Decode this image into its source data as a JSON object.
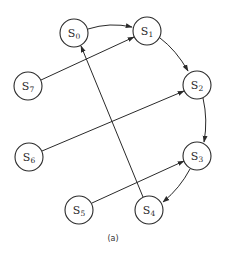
{
  "diagram": {
    "caption": "(a)",
    "colors": {
      "stroke": "#2a2a2a",
      "fill": "#ffffff"
    },
    "nodes": [
      {
        "id": "S0",
        "label": "S",
        "sub": "0",
        "x": 74,
        "y": 33
      },
      {
        "id": "S1",
        "label": "S",
        "sub": "1",
        "x": 147,
        "y": 31
      },
      {
        "id": "S2",
        "label": "S",
        "sub": "2",
        "x": 197,
        "y": 85
      },
      {
        "id": "S3",
        "label": "S",
        "sub": "3",
        "x": 197,
        "y": 156
      },
      {
        "id": "S4",
        "label": "S",
        "sub": "4",
        "x": 149,
        "y": 210
      },
      {
        "id": "S5",
        "label": "S",
        "sub": "5",
        "x": 79,
        "y": 210
      },
      {
        "id": "S6",
        "label": "S",
        "sub": "6",
        "x": 29,
        "y": 157
      },
      {
        "id": "S7",
        "label": "S",
        "sub": "7",
        "x": 28,
        "y": 86
      }
    ],
    "edges": [
      {
        "from": "S0",
        "to": "S1",
        "type": "curved"
      },
      {
        "from": "S1",
        "to": "S2",
        "type": "curved"
      },
      {
        "from": "S2",
        "to": "S3",
        "type": "curved"
      },
      {
        "from": "S3",
        "to": "S4",
        "type": "curved"
      },
      {
        "from": "S4",
        "to": "S0",
        "type": "straight"
      },
      {
        "from": "S5",
        "to": "S3",
        "type": "straight"
      },
      {
        "from": "S6",
        "to": "S2",
        "type": "straight"
      },
      {
        "from": "S7",
        "to": "S1",
        "type": "straight"
      }
    ]
  }
}
